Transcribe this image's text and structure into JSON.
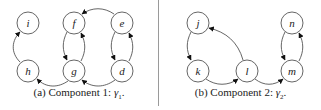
{
  "figure": {
    "panels": [
      {
        "id": "a",
        "caption_prefix": "(a) Component 1: ",
        "caption_symbol": "γ",
        "caption_subscript": "1",
        "caption_suffix": ".",
        "nodes": [
          {
            "id": "i",
            "label": "i",
            "x": 28,
            "y": 23
          },
          {
            "id": "h",
            "label": "h",
            "x": 28,
            "y": 71
          },
          {
            "id": "f",
            "label": "f",
            "x": 74,
            "y": 23
          },
          {
            "id": "g",
            "label": "g",
            "x": 74,
            "y": 71
          },
          {
            "id": "e",
            "label": "e",
            "x": 122,
            "y": 23
          },
          {
            "id": "d",
            "label": "d",
            "x": 122,
            "y": 71
          }
        ],
        "edges": [
          {
            "from": "h",
            "to": "i"
          },
          {
            "from": "g",
            "to": "h"
          },
          {
            "from": "f",
            "to": "g"
          },
          {
            "from": "g",
            "to": "f"
          },
          {
            "from": "e",
            "to": "f"
          },
          {
            "from": "d",
            "to": "g"
          },
          {
            "from": "e",
            "to": "d"
          },
          {
            "from": "d",
            "to": "e"
          }
        ]
      },
      {
        "id": "b",
        "caption_prefix": "(b) Component 2: ",
        "caption_symbol": "γ",
        "caption_subscript": "2",
        "caption_suffix": ".",
        "nodes": [
          {
            "id": "j",
            "label": "j",
            "x": 198,
            "y": 23
          },
          {
            "id": "k",
            "label": "k",
            "x": 198,
            "y": 71
          },
          {
            "id": "l",
            "label": "l",
            "x": 247,
            "y": 71
          },
          {
            "id": "n",
            "label": "n",
            "x": 292,
            "y": 23
          },
          {
            "id": "m",
            "label": "m",
            "x": 292,
            "y": 71
          }
        ],
        "edges": [
          {
            "from": "j",
            "to": "k"
          },
          {
            "from": "l",
            "to": "j"
          },
          {
            "from": "k",
            "to": "l"
          },
          {
            "from": "l",
            "to": "m"
          },
          {
            "from": "n",
            "to": "m"
          },
          {
            "from": "m",
            "to": "n"
          }
        ]
      }
    ]
  }
}
